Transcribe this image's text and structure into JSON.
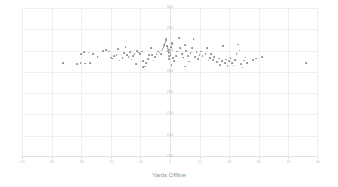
{
  "chart_data": {
    "type": "scatter",
    "title": "",
    "xlabel": "Yards Offline",
    "ylabel": "",
    "xlim": [
      -50,
      50
    ],
    "ylim": [
      200,
      340
    ],
    "grid": true,
    "legend": null,
    "marker_color": "#8d8d8d",
    "grid_color": "#efefef",
    "xticks": [
      -50,
      -40,
      -30,
      -20,
      -10,
      0,
      10,
      20,
      30,
      40,
      50
    ],
    "xtick_labels": [
      "-50",
      "-40",
      "-30",
      "-20",
      "-10",
      "0",
      "10",
      "20",
      "30",
      "40",
      "50"
    ],
    "yticks": [
      200,
      220,
      240,
      260,
      280,
      300,
      320,
      340
    ],
    "ytick_labels": [
      "200",
      "220",
      "240",
      "260",
      "280",
      "300",
      "320",
      "340"
    ],
    "points": [
      [
        -36.0,
        288.0
      ],
      [
        -31.5,
        287.5
      ],
      [
        -30.2,
        288.5
      ],
      [
        -28.8,
        287.8
      ],
      [
        -27.0,
        288.2
      ],
      [
        -30.0,
        297.0
      ],
      [
        -29.0,
        298.5
      ],
      [
        -27.5,
        298.0
      ],
      [
        -26.0,
        296.5
      ],
      [
        -24.5,
        294.0
      ],
      [
        -22.5,
        299.5
      ],
      [
        -21.5,
        300.5
      ],
      [
        -20.5,
        299.0
      ],
      [
        -20.0,
        293.5
      ],
      [
        -19.5,
        292.5
      ],
      [
        -19.0,
        294.5
      ],
      [
        -18.0,
        296.0
      ],
      [
        -17.5,
        301.5
      ],
      [
        -17.0,
        290.5
      ],
      [
        -16.0,
        293.0
      ],
      [
        -15.5,
        297.5
      ],
      [
        -15.0,
        303.0
      ],
      [
        -14.5,
        296.0
      ],
      [
        -14.0,
        294.0
      ],
      [
        -13.5,
        298.5
      ],
      [
        -13.0,
        291.5
      ],
      [
        -12.5,
        295.0
      ],
      [
        -12.0,
        297.0
      ],
      [
        -11.0,
        299.5
      ],
      [
        -10.5,
        298.0
      ],
      [
        -10.0,
        296.5
      ],
      [
        -9.5,
        299.0
      ],
      [
        -9.0,
        290.0
      ],
      [
        -8.5,
        285.0
      ],
      [
        -8.0,
        288.0
      ],
      [
        -7.5,
        292.0
      ],
      [
        -7.0,
        296.0
      ],
      [
        -6.5,
        302.0
      ],
      [
        -6.0,
        295.5
      ],
      [
        -5.5,
        290.5
      ],
      [
        -5.0,
        294.0
      ],
      [
        -4.5,
        297.0
      ],
      [
        -4.0,
        299.0
      ],
      [
        -3.5,
        298.0
      ],
      [
        -3.0,
        296.5
      ],
      [
        -2.8,
        300.0
      ],
      [
        -2.5,
        301.5
      ],
      [
        -2.2,
        303.5
      ],
      [
        -2.0,
        305.0
      ],
      [
        -1.8,
        306.5
      ],
      [
        -1.5,
        308.0
      ],
      [
        -1.3,
        309.5
      ],
      [
        -1.2,
        311.0
      ],
      [
        -1.0,
        304.0
      ],
      [
        -0.8,
        302.0
      ],
      [
        -0.6,
        299.5
      ],
      [
        -0.5,
        297.5
      ],
      [
        -0.4,
        295.0
      ],
      [
        -0.3,
        292.0
      ],
      [
        -0.2,
        300.5
      ],
      [
        0.0,
        298.0
      ],
      [
        0.2,
        296.0
      ],
      [
        0.4,
        303.0
      ],
      [
        0.6,
        305.5
      ],
      [
        0.8,
        307.0
      ],
      [
        1.0,
        293.0
      ],
      [
        1.5,
        290.0
      ],
      [
        2.0,
        294.5
      ],
      [
        2.5,
        299.0
      ],
      [
        3.0,
        311.5
      ],
      [
        3.5,
        302.5
      ],
      [
        4.0,
        297.0
      ],
      [
        4.5,
        293.5
      ],
      [
        5.0,
        305.0
      ],
      [
        5.5,
        299.5
      ],
      [
        6.0,
        295.0
      ],
      [
        6.5,
        289.5
      ],
      [
        7.0,
        297.5
      ],
      [
        7.5,
        302.0
      ],
      [
        8.0,
        311.0
      ],
      [
        8.5,
        294.0
      ],
      [
        9.0,
        298.5
      ],
      [
        9.5,
        292.0
      ],
      [
        10.0,
        296.0
      ],
      [
        10.5,
        299.0
      ],
      [
        11.0,
        294.5
      ],
      [
        12.0,
        297.0
      ],
      [
        12.5,
        302.5
      ],
      [
        13.0,
        290.5
      ],
      [
        13.5,
        293.0
      ],
      [
        14.0,
        296.5
      ],
      [
        14.5,
        291.0
      ],
      [
        15.0,
        294.0
      ],
      [
        16.0,
        289.0
      ],
      [
        16.5,
        292.5
      ],
      [
        17.0,
        286.5
      ],
      [
        17.5,
        290.0
      ],
      [
        18.0,
        304.0
      ],
      [
        18.5,
        288.0
      ],
      [
        19.0,
        291.5
      ],
      [
        19.5,
        285.5
      ],
      [
        20.0,
        290.0
      ],
      [
        20.5,
        293.0
      ],
      [
        21.0,
        288.5
      ],
      [
        21.5,
        286.0
      ],
      [
        22.0,
        291.0
      ],
      [
        22.5,
        296.5
      ],
      [
        23.0,
        305.5
      ],
      [
        23.5,
        300.0
      ],
      [
        24.0,
        287.0
      ],
      [
        24.5,
        284.0
      ],
      [
        25.0,
        290.5
      ],
      [
        25.5,
        293.5
      ],
      [
        26.0,
        288.0
      ],
      [
        28.0,
        291.0
      ],
      [
        29.0,
        292.5
      ],
      [
        31.0,
        294.0
      ],
      [
        -9.0,
        284.5
      ],
      [
        -11.5,
        287.0
      ],
      [
        0.5,
        286.5
      ],
      [
        5.0,
        285.0
      ],
      [
        46.0,
        288.0
      ]
    ]
  }
}
